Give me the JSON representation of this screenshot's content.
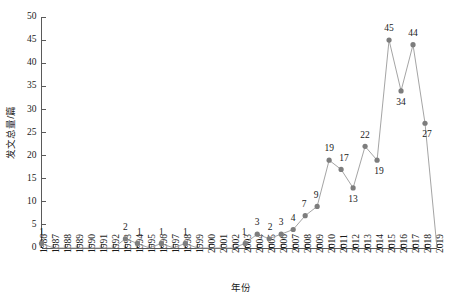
{
  "chart_data": {
    "type": "line",
    "title": "",
    "xlabel": "年份",
    "ylabel": "发文总量/篇",
    "grid": false,
    "legend": "none",
    "ylim": [
      0,
      50
    ],
    "yticks": [
      0,
      5,
      10,
      15,
      20,
      25,
      30,
      35,
      40,
      45,
      50
    ],
    "ytick_labels": [
      "0",
      "5",
      "10",
      "15",
      "20",
      "25",
      "30",
      "35",
      "40",
      "45",
      "50"
    ],
    "categories": [
      "1986",
      "1987",
      "1988",
      "1989",
      "1990",
      "1991",
      "1992",
      "1993",
      "1994",
      "1995",
      "1996",
      "1997",
      "1998",
      "1999",
      "2000",
      "2001",
      "2002",
      "2003",
      "2004",
      "2005",
      "2006",
      "2007",
      "2008",
      "2009",
      "2010",
      "2011",
      "2012",
      "2013",
      "2014",
      "2015",
      "2016",
      "2017",
      "2018",
      "2019"
    ],
    "values": [
      1,
      0,
      0,
      0,
      0,
      0,
      0,
      2,
      1,
      0,
      1,
      0,
      1,
      0,
      0,
      0,
      0,
      1,
      3,
      2,
      3,
      4,
      7,
      9,
      19,
      17,
      13,
      22,
      19,
      45,
      34,
      44,
      27,
      0
    ],
    "point_labels": [
      {
        "x": "1986",
        "y": 1,
        "text": "1",
        "dx": 0,
        "dy": -11
      },
      {
        "x": "1993",
        "y": 2,
        "text": "2",
        "dx": 0,
        "dy": -11
      },
      {
        "x": "1994",
        "y": 1,
        "text": "1",
        "dx": 2,
        "dy": -11
      },
      {
        "x": "1996",
        "y": 1,
        "text": "1",
        "dx": 0,
        "dy": -11
      },
      {
        "x": "1998",
        "y": 1,
        "text": "1",
        "dx": 0,
        "dy": -11
      },
      {
        "x": "2003",
        "y": 1,
        "text": "1",
        "dx": -1,
        "dy": -11
      },
      {
        "x": "2004",
        "y": 3,
        "text": "3",
        "dx": 0,
        "dy": -11
      },
      {
        "x": "2005",
        "y": 2,
        "text": "2",
        "dx": 1,
        "dy": -11
      },
      {
        "x": "2006",
        "y": 3,
        "text": "3",
        "dx": 0,
        "dy": -11
      },
      {
        "x": "2007",
        "y": 4,
        "text": "4",
        "dx": 0,
        "dy": -11
      },
      {
        "x": "2008",
        "y": 7,
        "text": "7",
        "dx": -1,
        "dy": -11
      },
      {
        "x": "2009",
        "y": 9,
        "text": "9",
        "dx": -1,
        "dy": -11
      },
      {
        "x": "2010",
        "y": 19,
        "text": "19",
        "dx": 0,
        "dy": -11
      },
      {
        "x": "2011",
        "y": 17,
        "text": "17",
        "dx": 3,
        "dy": -11
      },
      {
        "x": "2012",
        "y": 13,
        "text": "13",
        "dx": 0,
        "dy": 12
      },
      {
        "x": "2013",
        "y": 22,
        "text": "22",
        "dx": 0,
        "dy": -11
      },
      {
        "x": "2014",
        "y": 19,
        "text": "19",
        "dx": 2,
        "dy": 12
      },
      {
        "x": "2015",
        "y": 45,
        "text": "45",
        "dx": 0,
        "dy": -11
      },
      {
        "x": "2016",
        "y": 34,
        "text": "34",
        "dx": 0,
        "dy": 12
      },
      {
        "x": "2017",
        "y": 44,
        "text": "44",
        "dx": 0,
        "dy": -11
      },
      {
        "x": "2018",
        "y": 27,
        "text": "27",
        "dx": 2,
        "dy": 12
      }
    ],
    "colors": {
      "line": "#9a9a9a",
      "marker": "#7d7d7d",
      "axis": "#5a5a5a",
      "text": "#1a1a1a",
      "background": "#ffffff"
    }
  }
}
